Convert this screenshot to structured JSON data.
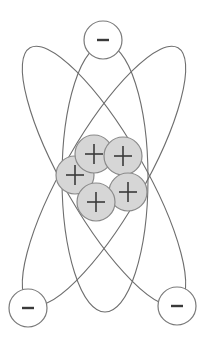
{
  "diagram": {
    "canvas": {
      "width": 207,
      "height": 346,
      "background": "#ffffff"
    },
    "colors": {
      "orbit_stroke": "#6e6e6e",
      "electron_fill": "#ffffff",
      "electron_stroke": "#7a7a7a",
      "proton_fill": "#d6d6d6",
      "proton_stroke": "#8a8a8a",
      "sign_color": "#3a3a3a"
    },
    "orbits": [
      {
        "name": "vertical-orbit",
        "cx": 105,
        "cy": 178,
        "rx": 43,
        "ry": 134,
        "rotate": 0
      },
      {
        "name": "tilted-orbit-left",
        "cx": 104,
        "cy": 176,
        "rx": 40,
        "ry": 148,
        "rotate": -30
      },
      {
        "name": "tilted-orbit-right",
        "cx": 104,
        "cy": 176,
        "rx": 40,
        "ry": 148,
        "rotate": 30
      }
    ],
    "electrons": [
      {
        "name": "electron-top",
        "cx": 103,
        "cy": 40,
        "r": 19,
        "label": "−"
      },
      {
        "name": "electron-bottom-left",
        "cx": 28,
        "cy": 308,
        "r": 19,
        "label": "−"
      },
      {
        "name": "electron-bottom-right",
        "cx": 177,
        "cy": 306,
        "r": 19,
        "label": "−"
      }
    ],
    "protons": [
      {
        "name": "proton-left",
        "cx": 75,
        "cy": 175,
        "r": 19,
        "label": "+"
      },
      {
        "name": "proton-top-left",
        "cx": 94,
        "cy": 154,
        "r": 19,
        "label": "+"
      },
      {
        "name": "proton-top-right",
        "cx": 123,
        "cy": 156,
        "r": 19,
        "label": "+"
      },
      {
        "name": "proton-right",
        "cx": 128,
        "cy": 192,
        "r": 19,
        "label": "+"
      },
      {
        "name": "proton-bottom",
        "cx": 96,
        "cy": 202,
        "r": 19,
        "label": "+"
      }
    ]
  }
}
